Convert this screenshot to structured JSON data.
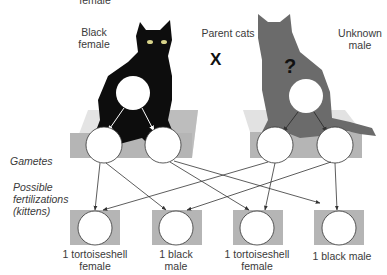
{
  "top_cut_label": "female",
  "parents": {
    "title": "Parent cats",
    "cross_symbol": "X",
    "female": {
      "label_line1": "Black",
      "label_line2": "female",
      "color": "#0d0d0d"
    },
    "male": {
      "label_line1": "Unknown",
      "label_line2": "male",
      "unknown_mark": "?",
      "color": "#6b6b6b"
    }
  },
  "rows": {
    "gametes": "Gametes",
    "fertilizations_line1": "Possible",
    "fertilizations_line2": "fertilizations",
    "fertilizations_line3": "(kittens)"
  },
  "kittens": [
    {
      "line1": "1 tortoiseshell",
      "line2": "female"
    },
    {
      "line1": "1 black",
      "line2": "male"
    },
    {
      "line1": "1 tortoiseshell",
      "line2": "female"
    },
    {
      "line1": "1 black male",
      "line2": ""
    }
  ],
  "colors": {
    "box_gray": "#b5b5b5",
    "platform_light": "#d9d9d9",
    "arrow": "#333333"
  }
}
